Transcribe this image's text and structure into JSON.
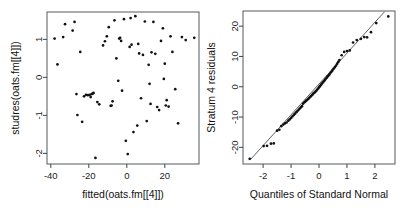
{
  "figure": {
    "background_color": "#ffffff",
    "point_color": "#111111",
    "axis_color": "#3f4346",
    "frame_color": "#555b5e",
    "panels": 2
  },
  "chart_data": [
    {
      "type": "scatter",
      "panel": "left",
      "title": "",
      "xlabel": "fitted(oats.fm[[4]])",
      "ylabel": "studres(oats.fm[[4]])",
      "xticks": [
        -40,
        -20,
        0,
        20
      ],
      "yticks": [
        1,
        0,
        -1,
        -2
      ],
      "xtick_labels": [
        "-40",
        "-20",
        "0",
        "20"
      ],
      "ytick_labels": [
        "1",
        "0",
        "-1",
        "-2"
      ],
      "xlim": [
        -42,
        38
      ],
      "ylim": [
        -2.28,
        1.72
      ],
      "grid": false,
      "legend": false,
      "n_points": 72,
      "x": [
        -38.0,
        -36.5,
        -33.5,
        -32.5,
        -28.5,
        -27.5,
        -26.5,
        -26.0,
        -24.5,
        -23.5,
        -22.5,
        -21.5,
        -20.5,
        -19.5,
        -19.0,
        -18.5,
        -18.0,
        -17.5,
        -16.5,
        -15.5,
        -14.5,
        -12.5,
        -11.5,
        -10.5,
        -9.5,
        -8.5,
        -8.0,
        -7.5,
        -6.5,
        -5.5,
        -4.5,
        -4.0,
        -3.5,
        -3.0,
        -2.5,
        -1.5,
        -0.5,
        0.5,
        1.5,
        2.0,
        2.5,
        3.5,
        4.5,
        5.5,
        6.0,
        6.5,
        7.5,
        8.5,
        9.5,
        10.5,
        11.5,
        12.0,
        12.5,
        13.0,
        14.0,
        15.0,
        16.0,
        17.0,
        18.0,
        19.0,
        19.5,
        20.0,
        20.5,
        21.0,
        22.0,
        23.0,
        24.0,
        25.5,
        27.0,
        29.0,
        31.0,
        35.5
      ],
      "y": [
        1.02,
        0.34,
        1.06,
        1.4,
        1.23,
        1.46,
        -0.44,
        -0.99,
        0.67,
        -1.17,
        -0.5,
        -0.46,
        -0.47,
        -0.46,
        -0.52,
        -0.44,
        -0.43,
        -0.41,
        -2.12,
        -0.65,
        -0.71,
        0.84,
        0.95,
        1.08,
        1.32,
        -0.75,
        -0.74,
        -0.63,
        1.5,
        0.5,
        -0.09,
        1.02,
        1.04,
        0.96,
        -0.35,
        1.53,
        -1.67,
        -2.02,
        0.8,
        1.56,
        0.86,
        -1.44,
        1.61,
        -1.27,
        0.88,
        0.63,
        -0.55,
        0.59,
        1.47,
        -1.15,
        0.33,
        -0.17,
        -0.7,
        0.66,
        1.46,
        0.62,
        -0.78,
        -0.86,
        0.96,
        1.29,
        -0.04,
        0.36,
        -0.74,
        -0.6,
        -0.77,
        1.08,
        0.67,
        -0.31,
        -1.21,
        1.06,
        0.98,
        1.04
      ]
    },
    {
      "type": "scatter",
      "panel": "right",
      "title": "",
      "xlabel": "Quantiles of Standard Normal",
      "ylabel": "Stratum 4 residuals",
      "xticks": [
        -2,
        -1,
        0,
        1,
        2
      ],
      "yticks": [
        20,
        10,
        0,
        -10,
        -20
      ],
      "xtick_labels": [
        "-2",
        "-1",
        "0",
        "1",
        "2"
      ],
      "ytick_labels": [
        "20",
        "10",
        "0",
        "-10",
        "-20"
      ],
      "xlim": [
        -2.72,
        2.72
      ],
      "ylim": [
        -25.5,
        25.0
      ],
      "grid": false,
      "legend": false,
      "reference_line": {
        "type": "qqline",
        "x_from": -2.45,
        "y_from": -24.0,
        "x_to": 2.35,
        "y_to": 24.8
      },
      "n_points": 72,
      "x": [
        -2.48,
        -1.98,
        -1.86,
        -1.72,
        -1.62,
        -1.5,
        -1.42,
        -1.35,
        -1.28,
        -1.22,
        -1.16,
        -1.1,
        -1.05,
        -1.0,
        -0.95,
        -0.9,
        -0.86,
        -0.81,
        -0.77,
        -0.73,
        -0.69,
        -0.65,
        -0.61,
        -0.57,
        -0.53,
        -0.49,
        -0.46,
        -0.42,
        -0.38,
        -0.35,
        -0.31,
        -0.28,
        -0.24,
        -0.21,
        -0.17,
        -0.14,
        -0.1,
        -0.07,
        -0.03,
        0.0,
        0.03,
        0.07,
        0.1,
        0.14,
        0.17,
        0.21,
        0.24,
        0.28,
        0.31,
        0.35,
        0.38,
        0.42,
        0.46,
        0.49,
        0.53,
        0.57,
        0.61,
        0.65,
        0.69,
        0.73,
        0.81,
        0.9,
        1.0,
        1.1,
        1.22,
        1.35,
        1.5,
        1.62,
        1.72,
        1.86,
        2.05,
        2.48
      ],
      "y": [
        -23.8,
        -19.6,
        -19.5,
        -18.8,
        -18.7,
        -14.5,
        -14.2,
        -13.0,
        -12.5,
        -12.1,
        -11.8,
        -11.2,
        -10.8,
        -10.3,
        -9.8,
        -9.3,
        -8.9,
        -8.4,
        -8.0,
        -7.6,
        -7.2,
        -6.8,
        -6.4,
        -5.6,
        -5.2,
        -4.9,
        -4.6,
        -4.3,
        -4.0,
        -3.7,
        -3.3,
        -3.0,
        -2.7,
        -2.3,
        -2.0,
        -1.7,
        -1.4,
        -1.0,
        -0.6,
        -0.2,
        0.2,
        0.6,
        1.0,
        1.4,
        1.8,
        2.2,
        2.6,
        3.0,
        3.4,
        3.8,
        4.2,
        4.7,
        5.1,
        5.6,
        6.0,
        6.5,
        7.0,
        7.6,
        8.2,
        8.8,
        10.4,
        11.5,
        11.8,
        12.0,
        14.6,
        15.4,
        15.8,
        16.4,
        16.3,
        18.0,
        21.0,
        23.2
      ]
    }
  ]
}
